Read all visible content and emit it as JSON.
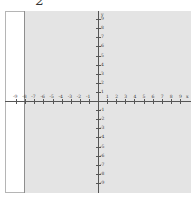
{
  "problem": {
    "number": "2"
  },
  "graph": {
    "x_axis_label": "x",
    "y_axis_label": "y",
    "x_ticks": [
      "-9",
      "-8",
      "-7",
      "-6",
      "-5",
      "-4",
      "-3",
      "-2",
      "-1",
      "1",
      "2",
      "3",
      "4",
      "5",
      "6",
      "7",
      "8",
      "9"
    ],
    "y_ticks_positive": [
      "9",
      "8",
      "7",
      "6",
      "5",
      "4",
      "3",
      "2",
      "1"
    ],
    "y_ticks_negative": [
      "-1",
      "-2",
      "-3",
      "-4",
      "-5",
      "-6",
      "-7",
      "-8",
      "-9"
    ],
    "x_range": [
      -9,
      9
    ],
    "y_range": [
      -9,
      9
    ],
    "colors": {
      "grid_bg": "#e4e4e4",
      "axis": "#555555",
      "border": "#b5b5b5"
    }
  }
}
